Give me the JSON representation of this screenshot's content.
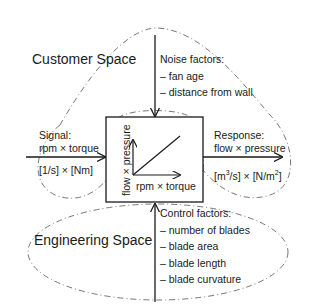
{
  "regions": {
    "customer_space": "Customer Space",
    "engineering_space": "Engineering Space"
  },
  "noise": {
    "title": "Noise factors:",
    "items": [
      "– fan age",
      "– distance from wall"
    ]
  },
  "signal": {
    "title": "Signal:",
    "quantity": "rpm × torque",
    "units": "[1/s] × [Nm]"
  },
  "response": {
    "title": "Response:",
    "quantity": "flow × pressure",
    "units_pre": "[m",
    "units_sup1": "3",
    "units_mid": "/s] × [N/m",
    "units_sup2": "2",
    "units_post": "]"
  },
  "system_box": {
    "x_axis_label": "rpm × torque",
    "y_axis_label": "flow × pressure"
  },
  "control": {
    "title": "Control factors:",
    "items": [
      "– number of blades",
      "– blade area",
      "– blade length",
      "– blade curvature"
    ]
  }
}
